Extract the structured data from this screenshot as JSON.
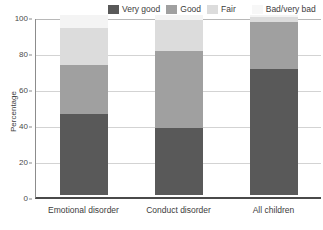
{
  "chart_data": {
    "type": "bar",
    "subtype": "stacked-vertical",
    "title": "",
    "xlabel": "",
    "ylabel": "Percentage",
    "ylim": [
      0,
      100
    ],
    "yticks": [
      0,
      20,
      40,
      60,
      80,
      100
    ],
    "ytick_labels": [
      "0",
      "20",
      "40",
      "60",
      "80",
      "100"
    ],
    "grid": true,
    "legend_position": "top-right",
    "categories": [
      "Emotional disorder",
      "Conduct disorder",
      "All children"
    ],
    "series": [
      {
        "name": "Very good",
        "color": "#595959",
        "values": [
          45,
          37,
          70
        ]
      },
      {
        "name": "Good",
        "color": "#a0a0a0",
        "values": [
          27,
          43,
          26
        ]
      },
      {
        "name": "Fair",
        "color": "#dcdcdc",
        "values": [
          21,
          17,
          3
        ]
      },
      {
        "name": "Bad/very bad",
        "color": "#f4f4f4",
        "values": [
          7,
          3,
          1
        ]
      }
    ],
    "stack_tops": [
      93,
      97,
      99
    ]
  },
  "legend": {
    "items": [
      {
        "label": "Very good",
        "color": "#595959"
      },
      {
        "label": "Good",
        "color": "#a0a0a0"
      },
      {
        "label": "Fair",
        "color": "#dcdcdc"
      },
      {
        "label": "Bad/very bad",
        "color": "#f4f4f4"
      }
    ]
  },
  "axes": {
    "y_title": "Percentage",
    "y_ticks": [
      "100",
      "80",
      "60",
      "40",
      "20",
      "0"
    ],
    "x_categories": [
      "Emotional disorder",
      "Conduct disorder",
      "All children"
    ]
  },
  "colors": {
    "very_good": "#595959",
    "good": "#a0a0a0",
    "fair": "#dcdcdc",
    "bad_very_bad": "#f4f4f4",
    "gridline": "#d3d3d3",
    "axis": "#4a4a4a",
    "text": "#3c3c3c",
    "background": "#ffffff"
  }
}
